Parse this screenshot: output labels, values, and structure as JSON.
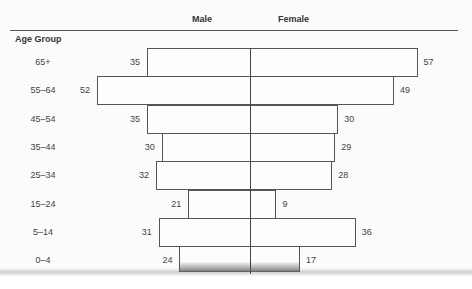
{
  "chart_data": {
    "type": "bar",
    "orientation": "horizontal",
    "subtype": "population-pyramid",
    "title": "",
    "xlabel": "",
    "ylabel": "Age Group",
    "categories": [
      "65+",
      "55–64",
      "45–54",
      "35–44",
      "25–34",
      "15–24",
      "5–14",
      "0–4"
    ],
    "series": [
      {
        "name": "Male",
        "side": "left",
        "values": [
          35,
          52,
          35,
          30,
          32,
          21,
          31,
          24
        ]
      },
      {
        "name": "Female",
        "side": "right",
        "values": [
          57,
          49,
          30,
          29,
          28,
          9,
          36,
          17
        ]
      }
    ],
    "grid": false,
    "legend_position": "top",
    "data_labels": true
  },
  "labels": {
    "male": "Male",
    "female": "Female",
    "axis_title": "Age Group"
  }
}
